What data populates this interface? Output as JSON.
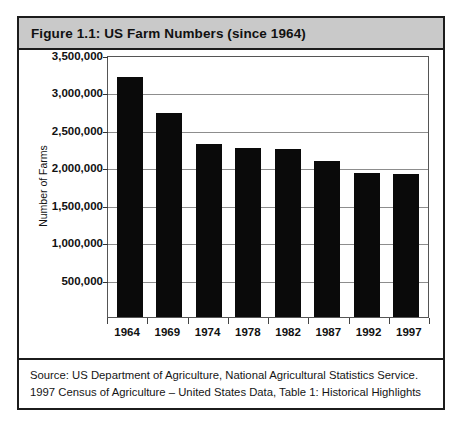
{
  "figure": {
    "title": "Figure 1.1: US Farm Numbers (since 1964)",
    "source_lines": [
      "Source: US Department of Agriculture, National Agricultural Statistics Service.",
      "1997 Census of Agriculture – United States Data, Table 1: Historical Highlights"
    ]
  },
  "colors": {
    "bar": "#0a0a0a",
    "header_band": "#c9c9c9",
    "border": "#1c1c1c",
    "gridline": "#8d8d8d",
    "plot_background": "#ffffff"
  },
  "chart_data": {
    "type": "bar",
    "title": "Figure 1.1: US Farm Numbers (since 1964)",
    "xlabel": "",
    "ylabel": "Number of Farms",
    "categories": [
      "1964",
      "1969",
      "1974",
      "1978",
      "1982",
      "1987",
      "1992",
      "1997"
    ],
    "values": [
      3200000,
      2730000,
      2310000,
      2260000,
      2240000,
      2090000,
      1930000,
      1910000
    ],
    "ylim": [
      0,
      3500000
    ],
    "yticks": [
      500000,
      1000000,
      1500000,
      2000000,
      2500000,
      3000000,
      3500000
    ],
    "ytick_labels": [
      "500,000",
      "1,000,000",
      "1,500,000",
      "2,000,000",
      "2,500,000",
      "3,000,000",
      "3,500,000"
    ],
    "grid": true,
    "legend": false,
    "orientation": "vertical"
  }
}
